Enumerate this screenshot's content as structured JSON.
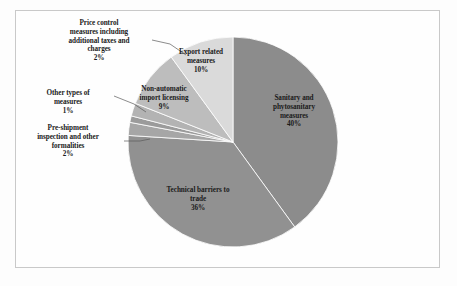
{
  "figure": {
    "background_color": "#fefefe",
    "frame_color": "#c9c9c9"
  },
  "chart_data": {
    "type": "pie",
    "title": "",
    "subtitle": "",
    "xlabel": "",
    "ylabel": "",
    "grid": false,
    "legend_position": "none",
    "labels_position": "callout-and-inside",
    "units": "percent",
    "total": 100,
    "categories": [
      "Sanitary and phytosanitary measures",
      "Technical barriers to trade",
      "Pre-shipment inspection and other formalities",
      "Other types of measures",
      "Price control measures including additional taxes and charges",
      "Non-automatic import licensing",
      "Export related measures"
    ],
    "values": [
      40,
      36,
      2,
      1,
      2,
      9,
      10
    ],
    "slices": [
      {
        "name": "Sanitary and phytosanitary measures",
        "label_lines": [
          "Sanitary and",
          "phytosanitary",
          "measures"
        ],
        "value": 40,
        "value_label": "40%",
        "color": "#8c8c8c",
        "start_angle_deg": 0,
        "end_angle_deg": 144,
        "label_style": "inside"
      },
      {
        "name": "Technical barriers to trade",
        "label_lines": [
          "Technical barriers to",
          "trade"
        ],
        "value": 36,
        "value_label": "36%",
        "color": "#919191",
        "start_angle_deg": 144,
        "end_angle_deg": 273.6,
        "label_style": "inside"
      },
      {
        "name": "Pre-shipment inspection and other formalities",
        "label_lines": [
          "Pre-shipment",
          "inspection and other",
          "formalities"
        ],
        "value": 2,
        "value_label": "2%",
        "color": "#a6a6a6",
        "start_angle_deg": 273.6,
        "end_angle_deg": 280.8,
        "label_style": "callout"
      },
      {
        "name": "Other types of measures",
        "label_lines": [
          "Other types of",
          "measures"
        ],
        "value": 1,
        "value_label": "1%",
        "color": "#9b9b9b",
        "start_angle_deg": 280.8,
        "end_angle_deg": 284.4,
        "label_style": "callout"
      },
      {
        "name": "Price control measures including additional taxes and charges",
        "label_lines": [
          "Price control",
          "measures including",
          "additional taxes and",
          "charges"
        ],
        "value": 2,
        "value_label": "2%",
        "color": "#b3b3b3",
        "start_angle_deg": 284.4,
        "end_angle_deg": 291.6,
        "label_style": "callout"
      },
      {
        "name": "Non-automatic import licensing",
        "label_lines": [
          "Non-automatic",
          "import licensing"
        ],
        "value": 9,
        "value_label": "9%",
        "color": "#bdbdbd",
        "start_angle_deg": 291.6,
        "end_angle_deg": 324,
        "label_style": "inside"
      },
      {
        "name": "Export related measures",
        "label_lines": [
          "Export related",
          "measures"
        ],
        "value": 10,
        "value_label": "10%",
        "color": "#dadada",
        "start_angle_deg": 324,
        "end_angle_deg": 360,
        "label_style": "inside"
      }
    ],
    "geometry": {
      "center_x": 233,
      "center_y": 142,
      "radius": 105
    }
  }
}
